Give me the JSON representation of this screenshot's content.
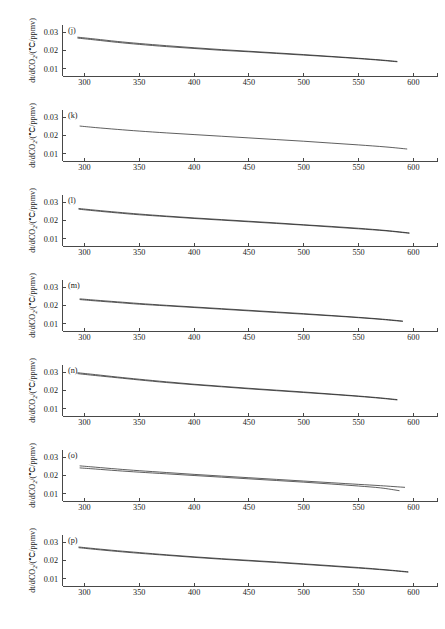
{
  "figure": {
    "width": 445,
    "height": 629,
    "background": "#ffffff",
    "foreground": "#1a1a1a",
    "panel_count": 7
  },
  "axis": {
    "xlabel_main": "CO",
    "xlabel_sub": "2",
    "xlabel_tail": "/ppmv",
    "ylabel_text": "dt/dCO₂/(℃/ppmv)",
    "ylabel_pre": "dt/dCO",
    "ylabel_sub": "2",
    "ylabel_post": "/(℃/ppmv)",
    "xticks": [
      300,
      350,
      400,
      450,
      500,
      550,
      600
    ],
    "xtick_labels": [
      "300",
      "350",
      "400",
      "450",
      "500",
      "550",
      "600"
    ],
    "yticks": [
      0.01,
      0.02,
      0.03
    ],
    "ytick_labels": [
      "0.01",
      "0.02",
      "0.03"
    ],
    "xlim": [
      280,
      622
    ],
    "ylim": [
      0.0062,
      0.0338
    ],
    "grid": false,
    "legend": null
  },
  "chart_data": [
    {
      "type": "line",
      "panel": "(j)",
      "title": "",
      "xlabel": "CO2/ppmv",
      "ylabel": "dt/dCO2/(℃/ppmv)",
      "xlim": [
        280,
        622
      ],
      "ylim": [
        0.0062,
        0.0338
      ],
      "xticks": [
        300,
        350,
        400,
        450,
        500,
        550,
        600
      ],
      "yticks": [
        0.01,
        0.02,
        0.03
      ],
      "grid": false,
      "series": [
        {
          "name": "upper",
          "x": [
            294,
            310,
            330,
            350,
            375,
            400,
            425,
            450,
            475,
            500,
            525,
            550,
            570,
            585
          ],
          "values": [
            0.0272,
            0.0262,
            0.0249,
            0.0238,
            0.0226,
            0.0215,
            0.0205,
            0.0196,
            0.0187,
            0.0178,
            0.0168,
            0.0158,
            0.0149,
            0.0141
          ]
        },
        {
          "name": "lower",
          "x": [
            294,
            310,
            330,
            350,
            375,
            400,
            425,
            450,
            475,
            500,
            525,
            550,
            570,
            585
          ],
          "values": [
            0.0267,
            0.0257,
            0.0244,
            0.0233,
            0.0221,
            0.0211,
            0.0201,
            0.0193,
            0.0184,
            0.0175,
            0.0166,
            0.0156,
            0.0147,
            0.0139
          ]
        }
      ]
    },
    {
      "type": "line",
      "panel": "(k)",
      "title": "",
      "xlabel": "CO2/ppmv",
      "ylabel": "dt/dCO2/(℃/ppmv)",
      "xlim": [
        280,
        622
      ],
      "ylim": [
        0.0062,
        0.0338
      ],
      "xticks": [
        300,
        350,
        400,
        450,
        500,
        550,
        600
      ],
      "yticks": [
        0.01,
        0.02,
        0.03
      ],
      "grid": false,
      "series": [
        {
          "name": "main",
          "x": [
            296,
            310,
            330,
            350,
            375,
            400,
            425,
            450,
            475,
            500,
            525,
            550,
            575,
            594
          ],
          "values": [
            0.0251,
            0.0243,
            0.0233,
            0.0224,
            0.0214,
            0.0205,
            0.0196,
            0.0187,
            0.0178,
            0.0169,
            0.0159,
            0.0149,
            0.0138,
            0.0127
          ]
        }
      ]
    },
    {
      "type": "line",
      "panel": "(l)",
      "title": "",
      "xlabel": "CO2/ppmv",
      "ylabel": "dt/dCO2/(℃/ppmv)",
      "xlim": [
        280,
        622
      ],
      "ylim": [
        0.0062,
        0.0338
      ],
      "xticks": [
        300,
        350,
        400,
        450,
        500,
        550,
        600
      ],
      "yticks": [
        0.01,
        0.02,
        0.03
      ],
      "grid": false,
      "series": [
        {
          "name": "upper",
          "x": [
            295,
            310,
            330,
            350,
            375,
            400,
            425,
            450,
            475,
            500,
            525,
            550,
            575,
            596
          ],
          "values": [
            0.0265,
            0.0256,
            0.0245,
            0.0235,
            0.0224,
            0.0214,
            0.0205,
            0.0196,
            0.0187,
            0.0177,
            0.0168,
            0.0158,
            0.0146,
            0.0133
          ]
        },
        {
          "name": "lower",
          "x": [
            295,
            310,
            330,
            350,
            375,
            400,
            425,
            450,
            475,
            500,
            525,
            550,
            575,
            596
          ],
          "values": [
            0.0261,
            0.0252,
            0.0241,
            0.0231,
            0.0221,
            0.0211,
            0.0202,
            0.0193,
            0.0184,
            0.0175,
            0.0165,
            0.0155,
            0.0144,
            0.0131
          ]
        }
      ]
    },
    {
      "type": "line",
      "panel": "(m)",
      "title": "",
      "xlabel": "CO2/ppmv",
      "ylabel": "dt/dCO2/(℃/ppmv)",
      "xlim": [
        280,
        622
      ],
      "ylim": [
        0.0062,
        0.0338
      ],
      "xticks": [
        300,
        350,
        400,
        450,
        500,
        550,
        600
      ],
      "yticks": [
        0.01,
        0.02,
        0.03
      ],
      "grid": false,
      "series": [
        {
          "name": "upper",
          "x": [
            296,
            310,
            330,
            350,
            375,
            400,
            425,
            450,
            475,
            500,
            525,
            550,
            572,
            590
          ],
          "values": [
            0.0236,
            0.0229,
            0.022,
            0.0211,
            0.0201,
            0.0192,
            0.0183,
            0.0174,
            0.0165,
            0.0156,
            0.0146,
            0.0136,
            0.0126,
            0.0116
          ]
        },
        {
          "name": "lower",
          "x": [
            296,
            310,
            330,
            350,
            375,
            400,
            425,
            450,
            475,
            500,
            525,
            550,
            572,
            590
          ],
          "values": [
            0.0232,
            0.0225,
            0.0216,
            0.0207,
            0.0198,
            0.0189,
            0.018,
            0.0171,
            0.0162,
            0.0153,
            0.0144,
            0.0134,
            0.0124,
            0.0114
          ]
        }
      ]
    },
    {
      "type": "line",
      "panel": "(n)",
      "title": "",
      "xlabel": "CO2/ppmv",
      "ylabel": "dt/dCO2/(℃/ppmv)",
      "xlim": [
        280,
        622
      ],
      "ylim": [
        0.0062,
        0.0338
      ],
      "xticks": [
        300,
        350,
        400,
        450,
        500,
        550,
        600
      ],
      "yticks": [
        0.01,
        0.02,
        0.03
      ],
      "grid": false,
      "series": [
        {
          "name": "upper",
          "x": [
            294,
            310,
            330,
            350,
            375,
            400,
            425,
            450,
            475,
            500,
            525,
            550,
            570,
            585
          ],
          "values": [
            0.0296,
            0.0286,
            0.0273,
            0.0261,
            0.0247,
            0.0234,
            0.0223,
            0.0212,
            0.0202,
            0.0192,
            0.0181,
            0.017,
            0.016,
            0.0151
          ]
        },
        {
          "name": "lower",
          "x": [
            294,
            310,
            330,
            350,
            375,
            400,
            425,
            450,
            475,
            500,
            525,
            550,
            570,
            585
          ],
          "values": [
            0.0291,
            0.0281,
            0.0269,
            0.0257,
            0.0243,
            0.0231,
            0.022,
            0.0209,
            0.0199,
            0.0189,
            0.0179,
            0.0168,
            0.0158,
            0.0149
          ]
        }
      ]
    },
    {
      "type": "line",
      "panel": "(o)",
      "title": "",
      "xlabel": "CO2/ppmv",
      "ylabel": "dt/dCO2/(℃/ppmv)",
      "xlim": [
        280,
        622
      ],
      "ylim": [
        0.0062,
        0.0338
      ],
      "xticks": [
        300,
        350,
        400,
        450,
        500,
        550,
        600
      ],
      "yticks": [
        0.01,
        0.02,
        0.03
      ],
      "grid": false,
      "series": [
        {
          "name": "upper",
          "x": [
            296,
            310,
            330,
            350,
            375,
            400,
            425,
            450,
            475,
            500,
            525,
            550,
            570,
            592
          ],
          "values": [
            0.0252,
            0.0245,
            0.0235,
            0.0226,
            0.0216,
            0.0206,
            0.0197,
            0.0188,
            0.0179,
            0.017,
            0.0161,
            0.0152,
            0.0145,
            0.0136
          ]
        },
        {
          "name": "lower",
          "x": [
            296,
            310,
            330,
            350,
            375,
            400,
            425,
            450,
            475,
            500,
            525,
            550,
            570,
            587
          ],
          "values": [
            0.0241,
            0.0235,
            0.0226,
            0.0218,
            0.0209,
            0.02,
            0.0191,
            0.0182,
            0.0173,
            0.0164,
            0.0154,
            0.0143,
            0.0133,
            0.0118
          ]
        }
      ]
    },
    {
      "type": "line",
      "panel": "(p)",
      "title": "",
      "xlabel": "CO2/ppmv",
      "ylabel": "dt/dCO2/(℃/ppmv)",
      "xlim": [
        280,
        622
      ],
      "ylim": [
        0.0062,
        0.0338
      ],
      "xticks": [
        300,
        350,
        400,
        450,
        500,
        550,
        600
      ],
      "yticks": [
        0.01,
        0.02,
        0.03
      ],
      "grid": false,
      "series": [
        {
          "name": "upper",
          "x": [
            295,
            310,
            330,
            350,
            375,
            400,
            425,
            450,
            475,
            500,
            525,
            550,
            575,
            595
          ],
          "values": [
            0.0273,
            0.0264,
            0.0253,
            0.0243,
            0.0231,
            0.022,
            0.021,
            0.0201,
            0.0192,
            0.0182,
            0.0172,
            0.0162,
            0.015,
            0.0139
          ]
        },
        {
          "name": "lower",
          "x": [
            295,
            310,
            330,
            350,
            375,
            400,
            425,
            450,
            475,
            500,
            525,
            550,
            575,
            595
          ],
          "values": [
            0.0269,
            0.026,
            0.0249,
            0.0239,
            0.0228,
            0.0217,
            0.0207,
            0.0198,
            0.0189,
            0.0179,
            0.0169,
            0.0159,
            0.0148,
            0.0137
          ]
        }
      ]
    }
  ]
}
